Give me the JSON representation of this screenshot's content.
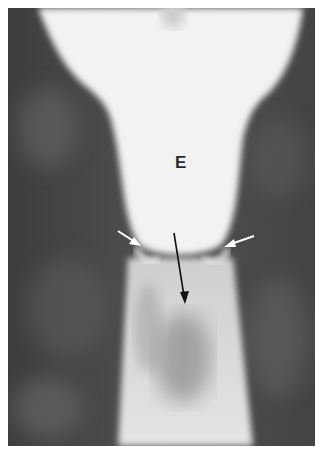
{
  "figure": {
    "type": "radiograph",
    "labels": {
      "esophagus": "E"
    },
    "annotations": [
      {
        "name": "left-white-arrow",
        "color": "#ffffff"
      },
      {
        "name": "right-white-arrow",
        "color": "#ffffff"
      },
      {
        "name": "black-arrow",
        "color": "#111111"
      }
    ]
  }
}
